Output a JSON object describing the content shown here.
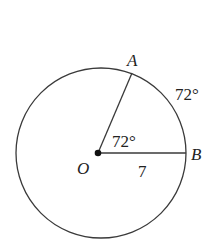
{
  "diagram": {
    "type": "circle-sector",
    "colors": {
      "stroke": "#3a3a3a",
      "text": "#222222",
      "background": "#ffffff"
    },
    "circle": {
      "cx": 101,
      "cy": 153,
      "r": 85
    },
    "center": {
      "label": "O",
      "x": 98,
      "y": 153
    },
    "points": [
      {
        "label": "A",
        "x": 132,
        "y": 73
      },
      {
        "label": "B",
        "x": 186,
        "y": 153
      }
    ],
    "radius_label": "7",
    "central_angle_label": "72°",
    "arc_label": "72°"
  }
}
